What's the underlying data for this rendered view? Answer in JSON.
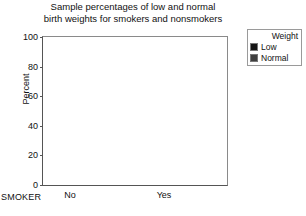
{
  "chart_data": {
    "type": "bar",
    "subtype": "stacked-bar-100",
    "title": "Sample percentages of low and normal birth weights for smokers and nonsmokers",
    "title_lines": [
      "Sample percentages of low and normal",
      "birth weights for smokers and nonsmokers"
    ],
    "xlabel": "SMOKER",
    "ylabel": "Percent",
    "categories": [
      "No",
      "Yes"
    ],
    "ylim": [
      0,
      100
    ],
    "yticks": [
      100,
      80,
      60,
      40,
      20,
      0
    ],
    "grid": false,
    "legend_position": "top-right-outside",
    "legend_title": "Weight",
    "series": [
      {
        "name": "Low",
        "color": "#151515",
        "values": [
          25,
          42
        ]
      },
      {
        "name": "Normal",
        "color": "#3f3f3f",
        "values": [
          75,
          58
        ]
      }
    ]
  },
  "legend": {
    "title": "Weight",
    "entries": [
      {
        "label": "Low",
        "color": "#151515"
      },
      {
        "label": "Normal",
        "color": "#3f3f3f"
      }
    ]
  },
  "axes": {
    "y_label": "Percent",
    "x_label": "SMOKER",
    "y_ticks": [
      "100",
      "80",
      "60",
      "40",
      "20",
      "0"
    ],
    "x_ticks": [
      "No",
      "Yes"
    ]
  },
  "colors": {
    "low": "#151515",
    "normal": "#3f3f3f",
    "frame": "#8a8a8a",
    "axis": "#555555",
    "background": "#ffffff",
    "text": "#111111"
  }
}
